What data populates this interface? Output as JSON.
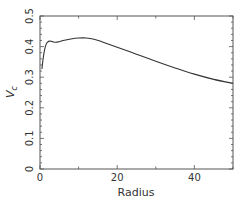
{
  "chart_data": {
    "type": "line",
    "title": "",
    "xlabel": "Radius",
    "ylabel": "V_c",
    "ylabel_main": "V",
    "ylabel_sub": "c",
    "xlim": [
      0,
      50
    ],
    "ylim": [
      0,
      0.5
    ],
    "xticks": [
      0,
      20,
      40
    ],
    "xtick_labels": [
      "0",
      "20",
      "40"
    ],
    "yticks": [
      0,
      0.1,
      0.2,
      0.3,
      0.4,
      0.5
    ],
    "ytick_labels": [
      "0",
      "0.1",
      "0.2",
      "0.3",
      "0.4",
      "0.5"
    ],
    "grid": false,
    "legend": null,
    "series": [
      {
        "name": "V_c",
        "color": "#333333",
        "x": [
          0.5,
          0.8,
          1.2,
          1.6,
          2.0,
          2.5,
          3.0,
          4.0,
          5.0,
          6.0,
          8.0,
          10.0,
          12.0,
          14.0,
          16.0,
          20.0,
          25.0,
          30.0,
          35.0,
          40.0,
          45.0,
          50.0
        ],
        "values": [
          0.327,
          0.36,
          0.39,
          0.408,
          0.415,
          0.418,
          0.417,
          0.414,
          0.416,
          0.42,
          0.425,
          0.428,
          0.428,
          0.424,
          0.416,
          0.398,
          0.375,
          0.352,
          0.33,
          0.31,
          0.293,
          0.28
        ]
      }
    ]
  }
}
